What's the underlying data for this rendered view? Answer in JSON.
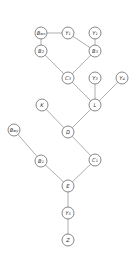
{
  "diagram": {
    "type": "directed-acyclic-graph",
    "node_radius": 6,
    "colors": {
      "edge": "#9a9a9a",
      "node_stroke": "#6a6a6a",
      "node_fill": "#ffffff",
      "text": "#333333"
    },
    "nodes": [
      {
        "id": "Bwo",
        "label": "B",
        "sub": "wo",
        "x": 41,
        "y": 33
      },
      {
        "id": "Y1",
        "label": "Y",
        "sub": "1",
        "x": 68,
        "y": 33
      },
      {
        "id": "Y2",
        "label": "Y",
        "sub": "1",
        "x": 95,
        "y": 33
      },
      {
        "id": "B2",
        "label": "B",
        "sub": "2",
        "x": 41,
        "y": 51
      },
      {
        "id": "B3",
        "label": "B",
        "sub": "3",
        "x": 95,
        "y": 51
      },
      {
        "id": "C3",
        "label": "C",
        "sub": "3",
        "x": 68,
        "y": 78
      },
      {
        "id": "Y3",
        "label": "Y",
        "sub": "3",
        "x": 95,
        "y": 78
      },
      {
        "id": "Y4",
        "label": "Y",
        "sub": "4",
        "x": 122,
        "y": 78
      },
      {
        "id": "K",
        "label": "K",
        "sub": "",
        "x": 42,
        "y": 105
      },
      {
        "id": "L",
        "label": "L",
        "sub": "",
        "x": 95,
        "y": 105
      },
      {
        "id": "D",
        "label": "D",
        "sub": "",
        "x": 68,
        "y": 132
      },
      {
        "id": "Bwy",
        "label": "B",
        "sub": "wy",
        "x": 14,
        "y": 130
      },
      {
        "id": "B1",
        "label": "B",
        "sub": "1",
        "x": 41,
        "y": 161
      },
      {
        "id": "C1",
        "label": "C",
        "sub": "1",
        "x": 95,
        "y": 160
      },
      {
        "id": "E",
        "label": "E",
        "sub": "",
        "x": 68,
        "y": 186
      },
      {
        "id": "Y5",
        "label": "Y",
        "sub": "5",
        "x": 68,
        "y": 213
      },
      {
        "id": "Z",
        "label": "Z",
        "sub": "",
        "x": 68,
        "y": 240
      }
    ],
    "edges": [
      {
        "from": "Bwo",
        "to": "Y1"
      },
      {
        "from": "Bwo",
        "to": "B2"
      },
      {
        "from": "Y1",
        "to": "B3"
      },
      {
        "from": "Y2",
        "to": "B3"
      },
      {
        "from": "B2",
        "to": "C3"
      },
      {
        "from": "B3",
        "to": "C3"
      },
      {
        "from": "C3",
        "to": "L"
      },
      {
        "from": "Y3",
        "to": "L"
      },
      {
        "from": "Y4",
        "to": "L"
      },
      {
        "from": "K",
        "to": "D"
      },
      {
        "from": "L",
        "to": "D"
      },
      {
        "from": "D",
        "to": "C1"
      },
      {
        "from": "Bwy",
        "to": "B1"
      },
      {
        "from": "B1",
        "to": "E"
      },
      {
        "from": "C1",
        "to": "E"
      },
      {
        "from": "E",
        "to": "Y5"
      },
      {
        "from": "Y5",
        "to": "Z"
      }
    ]
  }
}
